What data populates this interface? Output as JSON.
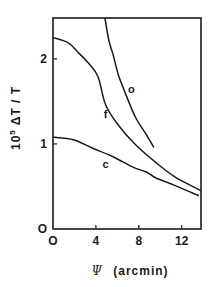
{
  "chart_data": {
    "type": "line",
    "title": "",
    "xlabel": "Ψ (arcmin)",
    "xlabel_symbol": "Ψ",
    "xlabel_unit": "(arcmin)",
    "ylabel": "10^5 ΔT / T",
    "ylabel_prefix": "10",
    "ylabel_exp": "5",
    "ylabel_body": "ΔT / T",
    "xlim": [
      0,
      13.8
    ],
    "ylim": [
      0,
      2.48
    ],
    "xticks": [
      0,
      4,
      8,
      12
    ],
    "xtick_labels": [
      "O",
      "4",
      "8",
      "12"
    ],
    "yticks": [
      0,
      1,
      2
    ],
    "ytick_labels": [
      "O",
      "1",
      "2"
    ],
    "grid": false,
    "legend": "none (curves labeled inline)",
    "series": [
      {
        "name": "o",
        "label_pos": [
          7.3,
          1.6
        ],
        "x": [
          4.84,
          5.2,
          5.6,
          6.1,
          6.8,
          7.7,
          8.7,
          9.4
        ],
        "y": [
          2.48,
          2.22,
          2.05,
          1.81,
          1.58,
          1.31,
          1.11,
          0.96
        ]
      },
      {
        "name": "f",
        "label_pos": [
          4.9,
          1.3
        ],
        "x": [
          0,
          1.4,
          2.3,
          3.3,
          4.2,
          4.9,
          6.1,
          7.7,
          9.6,
          11.4,
          13.8
        ],
        "y": [
          2.25,
          2.19,
          2.08,
          1.95,
          1.79,
          1.46,
          1.22,
          0.99,
          0.78,
          0.61,
          0.45
        ]
      },
      {
        "name": "c",
        "label_pos": [
          4.9,
          0.72
        ],
        "x": [
          0,
          1.9,
          3.7,
          5.6,
          7.4,
          8.7,
          9.6,
          11.4,
          13.6
        ],
        "y": [
          1.08,
          1.05,
          0.95,
          0.85,
          0.73,
          0.67,
          0.6,
          0.51,
          0.39
        ]
      }
    ]
  },
  "colors": {
    "ink": "#1a1a1a",
    "background": "#ffffff"
  }
}
